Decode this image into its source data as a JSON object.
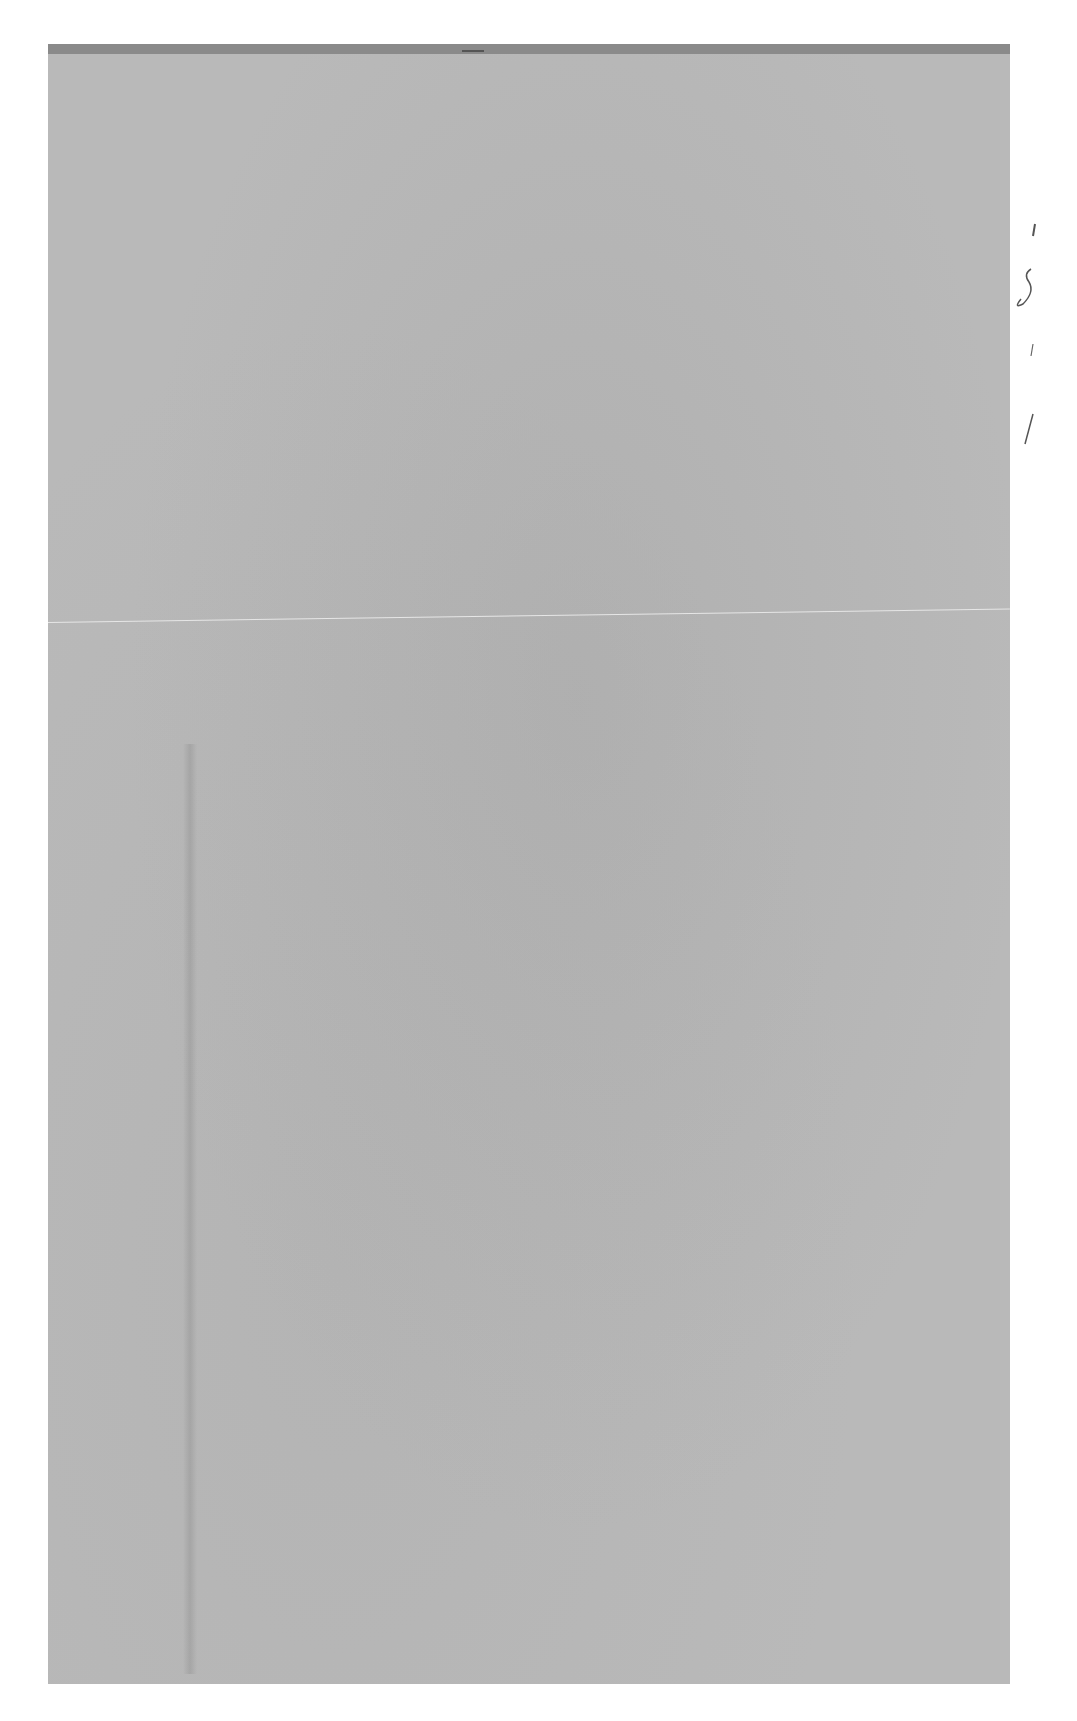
{
  "document": {
    "type": "scanned blank page",
    "text_content": "",
    "annotations": [
      "handwritten pencil marks at right margin (illegible)"
    ]
  },
  "colors": {
    "page": "#b9b9b9",
    "background": "#ffffff",
    "top_band": "#8a8a8a"
  }
}
